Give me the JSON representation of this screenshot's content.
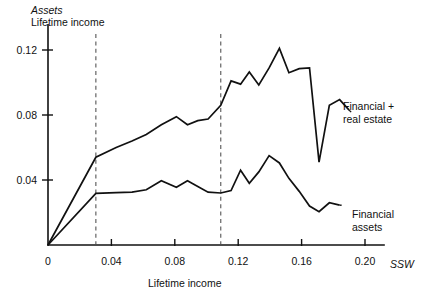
{
  "chart_data": {
    "type": "line",
    "title": "",
    "subtitle": "",
    "ylabel_line1": "Assets",
    "ylabel_line2": "Lifetime income",
    "xlabel": "Lifetime income",
    "xlabel_right": "SSW",
    "xlim": [
      0,
      0.212
    ],
    "ylim": [
      0,
      0.1355
    ],
    "grid": false,
    "legend_position": "inline-right-annotations",
    "xticks": [
      0,
      0.04,
      0.08,
      0.12,
      0.16,
      0.2
    ],
    "xticklabels": [
      "0",
      "0.04",
      "0.08",
      "0.12",
      "0.16",
      "0.20"
    ],
    "yticks": [
      0.04,
      0.08,
      0.12
    ],
    "yticklabels": [
      "0.04",
      "0.08",
      "0.12"
    ],
    "reference_lines": [
      {
        "name": "dashed-left",
        "x": 0.0302,
        "style": "dashed"
      },
      {
        "name": "dashed-right",
        "x": 0.109,
        "style": "dashed"
      }
    ],
    "series": [
      {
        "name": "Financial + real estate",
        "annotation_line1": "Financial +",
        "annotation_line2": "real estate",
        "x": [
          0.0,
          0.0302,
          0.043,
          0.053,
          0.062,
          0.0715,
          0.081,
          0.088,
          0.0945,
          0.101,
          0.109,
          0.1155,
          0.1215,
          0.127,
          0.133,
          0.1395,
          0.146,
          0.152,
          0.1585,
          0.165,
          0.171,
          0.1775,
          0.184,
          0.19
        ],
        "y": [
          0.0,
          0.054,
          0.06,
          0.064,
          0.068,
          0.074,
          0.079,
          0.074,
          0.0765,
          0.0775,
          0.086,
          0.101,
          0.099,
          0.1065,
          0.0985,
          0.109,
          0.121,
          0.106,
          0.1085,
          0.109,
          0.051,
          0.086,
          0.0895,
          0.083
        ]
      },
      {
        "name": "Financial assets",
        "annotation_line1": "Financial",
        "annotation_line2": "assets",
        "x": [
          0.0,
          0.0302,
          0.043,
          0.053,
          0.062,
          0.0715,
          0.081,
          0.088,
          0.0945,
          0.101,
          0.109,
          0.1155,
          0.1215,
          0.127,
          0.133,
          0.1395,
          0.146,
          0.152,
          0.1585,
          0.165,
          0.171,
          0.1775,
          0.184
        ],
        "y": [
          0.0,
          0.0318,
          0.0322,
          0.0325,
          0.034,
          0.0395,
          0.0355,
          0.0395,
          0.036,
          0.0325,
          0.032,
          0.0335,
          0.046,
          0.038,
          0.045,
          0.055,
          0.0505,
          0.041,
          0.033,
          0.024,
          0.0205,
          0.026,
          0.0245
        ]
      }
    ]
  },
  "annotations": {
    "financial_real_estate": {
      "line1": "Financial +",
      "line2": "real estate"
    },
    "financial_assets": {
      "line1": "Financial",
      "line2": "assets"
    }
  },
  "axes": {
    "y_title_italic": "Assets",
    "y_title_sub": "Lifetime income",
    "x_title": "Lifetime income",
    "x_axis_variable": "SSW"
  },
  "colors": {
    "ink": "#111111",
    "dashed": "#555555",
    "background": "#ffffff"
  }
}
